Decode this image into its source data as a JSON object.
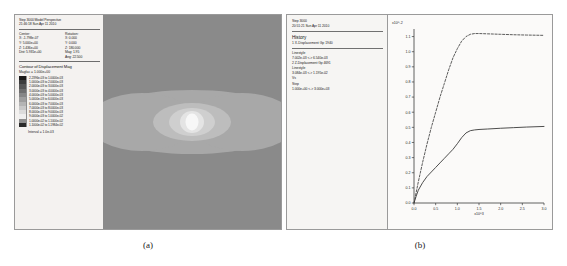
{
  "figure": {
    "captions": {
      "a": "(a)",
      "b": "(b)"
    }
  },
  "panel_a": {
    "header": {
      "step": "Step 3000  Model Perspective",
      "timestamp": "21:46:18  Sun Apr 11 2010"
    },
    "center_label": "Center:",
    "rotation_label": "Rotation:",
    "center": [
      "X: -1.798e-07",
      "Y: 5.000e+00",
      "Z: 1.436e+00",
      "Dist: 5.931e+00"
    ],
    "rotation": [
      "X:   0.000",
      "Y:   0.000",
      "Z: 180.000",
      "Mag:      1.95",
      "Ang:   22.500"
    ],
    "contour_title": "Contour of Displacement Mag",
    "magfac": "Magfac = 1.000e+00",
    "legend_rows": [
      {
        "label": "2.2396e-03 to 1.0000e-03",
        "color": "#1a1a1a"
      },
      {
        "label": "1.0000e-03 to 2.0000e-03",
        "color": "#3c3c3c"
      },
      {
        "label": "2.0000e-03 to 3.0000e-03",
        "color": "#565656"
      },
      {
        "label": "3.0000e-03 to 4.0000e-03",
        "color": "#6e6e6e"
      },
      {
        "label": "4.0000e-03 to 5.0000e-03",
        "color": "#868686"
      },
      {
        "label": "5.0000e-03 to 6.0000e-03",
        "color": "#9e9e9e"
      },
      {
        "label": "6.0000e-03 to 7.0000e-03",
        "color": "#b4b4b4"
      },
      {
        "label": "7.0000e-03 to 8.0000e-03",
        "color": "#c8c8c8"
      },
      {
        "label": "8.0000e-03 to 9.0000e-03",
        "color": "#dcdcdc"
      },
      {
        "label": "9.0000e-03 to 1.0000e-02",
        "color": "#efefef"
      },
      {
        "label": "1.0000e-02 to 1.1000e-02",
        "color": "#8e8e8e"
      },
      {
        "label": "1.1000e-02 to 1.1984e-02",
        "color": "#2a2a2a"
      }
    ],
    "interval": "Interval = 1.0e-03"
  },
  "panel_b": {
    "info": {
      "step": "Step 3000",
      "timestamp": "20:51:21  Sun Apr 11 2010",
      "history_heading": "History",
      "history_items": [
        "1 X-Displacement Gp 1940"
      ],
      "linestyle_label_1": "Linestyle",
      "linestyle_values_1": [
        "7.002e-03 <-> 6.540e-03",
        "2 Z-Displacement Gp 4691"
      ],
      "linestyle_label_2": "Linestyle",
      "linestyle_values_2": [
        "3.084e-03 <-> 1.195e-02"
      ],
      "vs_label": "Vs",
      "step_label": "Step",
      "step_range": "1.000e+00 <-> 3.000e+03"
    },
    "chart_axis": {
      "y_exponent": "x10^-2",
      "x_exponent": "x10^3"
    }
  },
  "chart_data": {
    "type": "line",
    "title": "",
    "xlabel": "Step (x10^3)",
    "ylabel": "Displacement (x10^-2)",
    "xlim": [
      0.0,
      3.0
    ],
    "ylim": [
      0.0,
      1.15
    ],
    "xticks": [
      0.0,
      0.5,
      1.0,
      1.5,
      2.0,
      2.5,
      3.0
    ],
    "xticklabels": [
      "0.0",
      "0.5",
      "1.0",
      "1.5",
      "2.0",
      "2.5",
      "3.0"
    ],
    "yticks": [
      0.0,
      0.1,
      0.2,
      0.3,
      0.4,
      0.5,
      0.6,
      0.7,
      0.8,
      0.9,
      1.0,
      1.1
    ],
    "yticklabels": [
      "0.0",
      "0.1",
      "0.2",
      "0.3",
      "0.4",
      "0.5",
      "0.6",
      "0.7",
      "0.8",
      "0.9",
      "1.0",
      "1.1"
    ],
    "grid": false,
    "legend_position": "none",
    "series": [
      {
        "name": "2 Z-Displacement Gp 4691",
        "style": "dashed",
        "color": "#4a4a4a",
        "x": [
          0.0,
          0.05,
          0.1,
          0.2,
          0.3,
          0.4,
          0.5,
          0.6,
          0.7,
          0.8,
          0.9,
          1.0,
          1.1,
          1.2,
          1.3,
          1.4,
          1.5,
          1.7,
          2.0,
          2.3,
          2.6,
          3.0
        ],
        "y": [
          0.0,
          0.07,
          0.14,
          0.27,
          0.39,
          0.5,
          0.6,
          0.7,
          0.79,
          0.88,
          0.96,
          1.02,
          1.07,
          1.1,
          1.115,
          1.12,
          1.12,
          1.118,
          1.115,
          1.112,
          1.11,
          1.108
        ]
      },
      {
        "name": "1 X-Displacement Gp 1940",
        "style": "solid",
        "color": "#3a3a3a",
        "x": [
          0.0,
          0.05,
          0.1,
          0.2,
          0.3,
          0.4,
          0.5,
          0.6,
          0.7,
          0.8,
          0.9,
          1.0,
          1.1,
          1.2,
          1.3,
          1.4,
          1.5,
          1.7,
          2.0,
          2.3,
          2.6,
          3.0
        ],
        "y": [
          0.0,
          0.045,
          0.085,
          0.135,
          0.175,
          0.205,
          0.235,
          0.265,
          0.295,
          0.325,
          0.355,
          0.392,
          0.432,
          0.463,
          0.478,
          0.483,
          0.486,
          0.489,
          0.494,
          0.498,
          0.502,
          0.506
        ]
      }
    ]
  }
}
